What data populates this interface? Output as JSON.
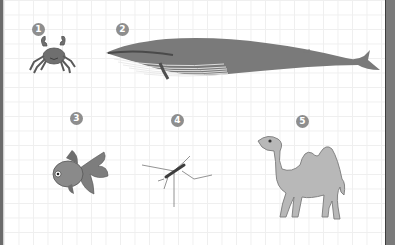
{
  "figure": {
    "colors": {
      "badge": "#8e8e8e",
      "animal_fill": "#7d7d7d",
      "camel_fill": "#b8b8b8",
      "grid": "#efefef"
    },
    "items": [
      {
        "number": "1",
        "animal": "crab"
      },
      {
        "number": "2",
        "animal": "whale"
      },
      {
        "number": "3",
        "animal": "goldfish"
      },
      {
        "number": "4",
        "animal": "mosquito"
      },
      {
        "number": "5",
        "animal": "camel"
      }
    ]
  }
}
